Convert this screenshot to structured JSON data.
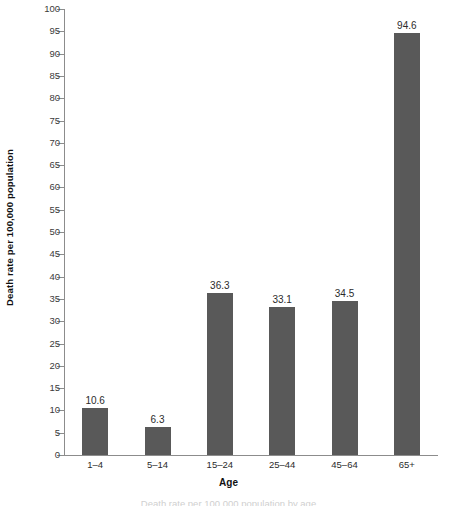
{
  "chart_data": {
    "type": "bar",
    "title": "",
    "subtitle": "",
    "xlabel": "Age",
    "ylabel": "Death rate per 100,000 population",
    "categories": [
      "1–4",
      "5–14",
      "15–24",
      "25–44",
      "45–64",
      "65+"
    ],
    "values": [
      10.6,
      6.3,
      36.3,
      33.1,
      34.5,
      94.6
    ],
    "value_labels": [
      "10.6",
      "6.3",
      "36.3",
      "33.1",
      "34.5",
      "94.6"
    ],
    "ylim": [
      0,
      100
    ],
    "ytick_step": 5,
    "yticks": [
      0,
      5,
      10,
      15,
      20,
      25,
      30,
      35,
      40,
      45,
      50,
      55,
      60,
      65,
      70,
      75,
      80,
      85,
      90,
      95,
      100
    ],
    "ytick_labels": [
      "0",
      "5",
      "10",
      "15",
      "20",
      "25",
      "30",
      "35",
      "40",
      "45",
      "50",
      "55",
      "60",
      "65",
      "70",
      "75",
      "80",
      "85",
      "90",
      "95",
      "100"
    ],
    "grid": false,
    "legend": null,
    "legend_position": "none",
    "series": [
      {
        "name": "Death rate",
        "values": [
          10.6,
          6.3,
          36.3,
          33.1,
          34.5,
          94.6
        ]
      }
    ],
    "colors": {
      "bar_fill": "#595959",
      "axis_line": "#8c8c8c",
      "tick_label": "#3b3b3b",
      "value_label": "#2b2b2b",
      "axis_title": "#111111",
      "background": "#ffffff"
    }
  },
  "caption_sliver": "Death rate per 100,000 population by age"
}
